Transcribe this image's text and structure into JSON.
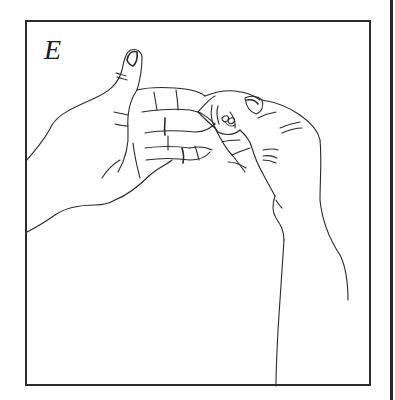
{
  "figure": {
    "panel_label": "E",
    "colors": {
      "background": "#ffffff",
      "line": "#2a2a2a",
      "frame": "#2b2b2b"
    }
  }
}
